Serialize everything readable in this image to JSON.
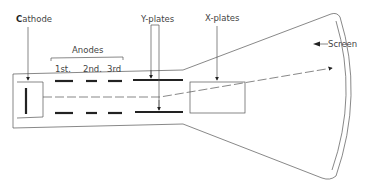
{
  "diagram": {
    "labels": {
      "cathode_initial": "C",
      "cathode_rest": "athode",
      "anodes": "Anodes",
      "anode_1": "1st.",
      "anode_2": "2nd.",
      "anode_3": "3rd",
      "y_plates": "Y-plates",
      "x_plates": "X-plates",
      "screen": "Screen"
    },
    "components": [
      "cathode",
      "anodes (1st, 2nd, 3rd)",
      "Y-plates",
      "X-plates",
      "screen"
    ],
    "colors": {
      "line": "#333333",
      "background": "#ffffff"
    }
  }
}
